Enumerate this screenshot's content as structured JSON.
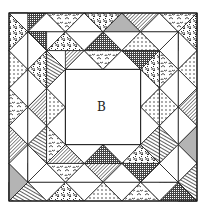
{
  "diagram": {
    "center_label": "B",
    "geometry": {
      "x0": 9,
      "y0": 13,
      "unit": 18.8,
      "grid_units": 10,
      "ring_rows": 3,
      "center_units": 4
    },
    "colors": {
      "line": "#1a1a1a",
      "gray": "#b4b4b4",
      "background": "#ffffff"
    },
    "fills": [
      "white",
      "dots",
      "wave",
      "hatch",
      "stripe",
      "dense",
      "gray",
      "floral"
    ],
    "rings": [
      {
        "name": "outer-ring",
        "pattern": [
          "dense",
          "white",
          "wave",
          "white",
          "floral",
          "gray",
          "hatch",
          "white",
          "wave",
          "white",
          "floral",
          "white",
          "dots",
          "white",
          "hatch",
          "white",
          "gray",
          "white",
          "stripe",
          "white",
          "dense",
          "white",
          "wave",
          "white",
          "dots",
          "white",
          "floral",
          "white",
          "stripe",
          "white",
          "gray",
          "white",
          "hatch",
          "white",
          "wave",
          "white",
          "dots",
          "white",
          "floral",
          "white"
        ]
      },
      {
        "name": "middle-ring",
        "pattern": [
          "white",
          "floral",
          "white",
          "dense",
          "white",
          "dots",
          "white",
          "hatch",
          "white",
          "wave",
          "white",
          "dots",
          "white",
          "stripe",
          "white",
          "floral",
          "white",
          "dense",
          "white",
          "hatch",
          "white",
          "wave",
          "white",
          "dots",
          "white",
          "stripe",
          "white",
          "hatch",
          "white",
          "floral",
          "white",
          "dense"
        ]
      },
      {
        "name": "inner-ring",
        "pattern": [
          "hatch",
          "white",
          "wave",
          "white",
          "dense",
          "white",
          "floral",
          "white",
          "dots",
          "white",
          "stripe",
          "white",
          "floral",
          "white",
          "dense",
          "white",
          "hatch",
          "white",
          "wave",
          "white",
          "dots",
          "white",
          "stripe",
          "white"
        ]
      }
    ]
  }
}
